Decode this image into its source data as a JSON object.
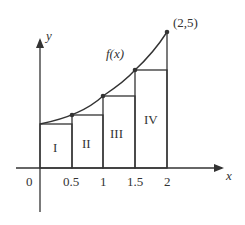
{
  "diagram": {
    "axes": {
      "x_label": "x",
      "y_label": "y",
      "origin_label": "0"
    },
    "x_ticks": [
      "0.5",
      "1",
      "1.5",
      "2"
    ],
    "curve_label": "f(x)",
    "endpoint_label": "(2,5)",
    "rectangles": [
      "I",
      "II",
      "III",
      "IV"
    ],
    "colors": {
      "stroke": "#333333",
      "background": "#ffffff"
    }
  }
}
